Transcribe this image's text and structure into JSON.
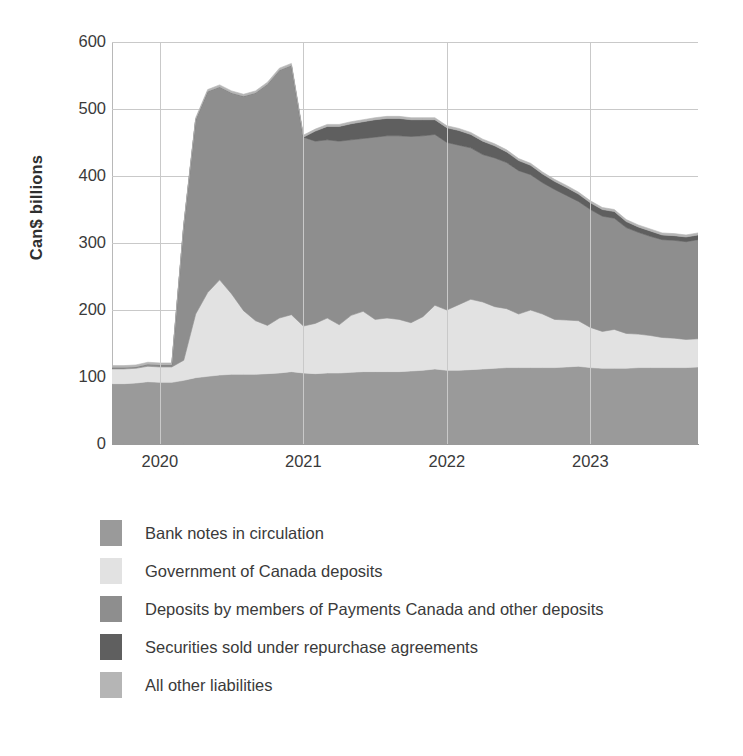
{
  "chart_data": {
    "type": "area",
    "stacked": true,
    "title": "",
    "subtitle": "",
    "xlabel": "",
    "ylabel": "Can$ billions",
    "ylim": [
      0,
      600
    ],
    "yticks": [
      0,
      100,
      200,
      300,
      400,
      500,
      600
    ],
    "ytick_labels": [
      "0",
      "100",
      "200",
      "300",
      "400",
      "500",
      "600"
    ],
    "xticks": [
      "2020",
      "2021",
      "2022",
      "2023"
    ],
    "xtick_labels": [
      "2020",
      "2021",
      "2022",
      "2023"
    ],
    "xlim": [
      "2019-09",
      "2023-11"
    ],
    "grid": "horizontal",
    "legend_position": "below",
    "x": [
      "2019-09",
      "2019-10",
      "2019-11",
      "2019-12",
      "2020-01",
      "2020-02",
      "2020-03",
      "2020-04",
      "2020-05",
      "2020-06",
      "2020-07",
      "2020-08",
      "2020-09",
      "2020-10",
      "2020-11",
      "2020-12",
      "2021-01",
      "2021-02",
      "2021-03",
      "2021-04",
      "2021-05",
      "2021-06",
      "2021-07",
      "2021-08",
      "2021-09",
      "2021-10",
      "2021-11",
      "2021-12",
      "2022-01",
      "2022-02",
      "2022-03",
      "2022-04",
      "2022-05",
      "2022-06",
      "2022-07",
      "2022-08",
      "2022-09",
      "2022-10",
      "2022-11",
      "2022-12",
      "2023-01",
      "2023-02",
      "2023-03",
      "2023-04",
      "2023-05",
      "2023-06",
      "2023-07",
      "2023-08",
      "2023-09",
      "2023-10"
    ],
    "series": [
      {
        "name": "Bank notes in circulation",
        "color": "#9a9a9a",
        "values": [
          90,
          90,
          91,
          93,
          92,
          92,
          95,
          99,
          101,
          103,
          104,
          104,
          104,
          105,
          106,
          108,
          106,
          105,
          106,
          106,
          107,
          108,
          108,
          108,
          108,
          109,
          110,
          112,
          110,
          110,
          111,
          112,
          113,
          114,
          114,
          114,
          114,
          114,
          115,
          116,
          114,
          113,
          113,
          113,
          114,
          114,
          114,
          114,
          114,
          115
        ]
      },
      {
        "name": "Government of Canada deposits",
        "color": "#e2e2e2",
        "values": [
          22,
          22,
          22,
          23,
          23,
          23,
          30,
          95,
          125,
          142,
          120,
          95,
          80,
          72,
          82,
          85,
          70,
          75,
          82,
          72,
          85,
          90,
          78,
          80,
          78,
          72,
          80,
          95,
          90,
          98,
          105,
          100,
          92,
          88,
          80,
          86,
          80,
          72,
          70,
          68,
          60,
          55,
          58,
          52,
          50,
          48,
          45,
          44,
          42,
          42
        ]
      },
      {
        "name": "Deposits by members of Payments Canada and other deposits",
        "color": "#8e8e8e",
        "values": [
          2,
          2,
          2,
          3,
          3,
          3,
          200,
          290,
          300,
          288,
          300,
          320,
          340,
          360,
          370,
          372,
          282,
          272,
          266,
          274,
          262,
          258,
          272,
          272,
          274,
          278,
          270,
          255,
          250,
          238,
          226,
          220,
          222,
          218,
          214,
          202,
          196,
          194,
          186,
          178,
          176,
          172,
          166,
          158,
          152,
          148,
          146,
          146,
          146,
          148
        ]
      },
      {
        "name": "Securities sold under repurchase agreements",
        "color": "#5f5f5f",
        "values": [
          0,
          0,
          0,
          0,
          0,
          0,
          0,
          0,
          0,
          0,
          0,
          0,
          0,
          0,
          0,
          0,
          0,
          15,
          20,
          22,
          24,
          25,
          26,
          26,
          26,
          25,
          24,
          22,
          22,
          22,
          20,
          20,
          18,
          16,
          15,
          14,
          13,
          12,
          12,
          11,
          10,
          10,
          10,
          9,
          8,
          8,
          7,
          7,
          7,
          7
        ]
      },
      {
        "name": "All other liabilities",
        "color": "#b5b5b5",
        "values": [
          3,
          3,
          3,
          3,
          3,
          3,
          3,
          3,
          3,
          3,
          3,
          3,
          3,
          3,
          3,
          3,
          3,
          3,
          3,
          3,
          3,
          3,
          3,
          3,
          3,
          3,
          3,
          3,
          3,
          3,
          3,
          3,
          3,
          3,
          3,
          3,
          3,
          3,
          3,
          3,
          3,
          3,
          3,
          3,
          3,
          3,
          3,
          3,
          3,
          3
        ]
      }
    ],
    "annotations": [
      {
        "label": "peak total",
        "x": "2020-12",
        "value": 570
      },
      {
        "label": "final total",
        "x": "2023-10",
        "value": 318
      }
    ]
  },
  "axis": {
    "y_title": "Can$ billions",
    "y_ticks": [
      {
        "label": "600",
        "value": 600
      },
      {
        "label": "500",
        "value": 500
      },
      {
        "label": "400",
        "value": 400
      },
      {
        "label": "300",
        "value": 300
      },
      {
        "label": "200",
        "value": 200
      },
      {
        "label": "100",
        "value": 100
      },
      {
        "label": "0",
        "value": 0
      }
    ],
    "x_ticks": [
      {
        "label": "2020",
        "value": "2020-01"
      },
      {
        "label": "2021",
        "value": "2021-01"
      },
      {
        "label": "2022",
        "value": "2022-01"
      },
      {
        "label": "2023",
        "value": "2023-01"
      }
    ]
  },
  "legend": {
    "items": [
      {
        "label": "Bank notes in circulation",
        "color": "#9a9a9a"
      },
      {
        "label": "Government of Canada deposits",
        "color": "#e2e2e2"
      },
      {
        "label": "Deposits by members of Payments Canada and other deposits",
        "color": "#8e8e8e"
      },
      {
        "label": "Securities sold under repurchase agreements",
        "color": "#5f5f5f"
      },
      {
        "label": "All other liabilities",
        "color": "#b5b5b5"
      }
    ]
  }
}
